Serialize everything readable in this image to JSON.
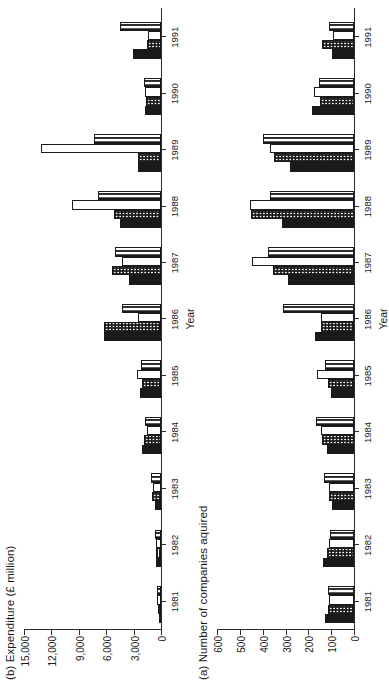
{
  "figure": {
    "orientation": "rotated-90-ccw",
    "panels": [
      "b",
      "a"
    ]
  },
  "panel_b": {
    "title": "(b) Expenditure (£ million)",
    "xlabel": "Year",
    "yticks": [
      "0",
      "3,000",
      "6,000",
      "9,000",
      "12,000",
      "15,000"
    ]
  },
  "panel_a": {
    "title": "(a) Number of companies aquired",
    "xlabel": "Year",
    "yticks": [
      "0",
      "100",
      "200",
      "300",
      "400",
      "500",
      "600"
    ]
  },
  "chart_data": [
    {
      "id": "panel_a",
      "type": "bar",
      "title": "(a) Number of companies aquired",
      "xlabel": "Year",
      "ylabel": "",
      "ylim": [
        0,
        600
      ],
      "yticks": [
        0,
        100,
        200,
        300,
        400,
        500,
        600
      ],
      "grid": false,
      "legend": "none",
      "orientation": "vertical-bars-rotated",
      "categories": [
        "1981",
        "1982",
        "1983",
        "1984",
        "1985",
        "1986",
        "1987",
        "1988",
        "1989",
        "1990",
        "1991"
      ],
      "series": [
        {
          "name": "series-1-solid",
          "pattern": "solid",
          "values": [
            125,
            135,
            95,
            120,
            100,
            170,
            290,
            315,
            280,
            185,
            95
          ]
        },
        {
          "name": "series-2-dotted",
          "pattern": "dotted",
          "values": [
            115,
            120,
            110,
            140,
            115,
            145,
            355,
            450,
            350,
            150,
            140
          ]
        },
        {
          "name": "series-3-open",
          "pattern": "open",
          "values": [
            110,
            110,
            110,
            145,
            160,
            145,
            445,
            455,
            370,
            175,
            90
          ]
        },
        {
          "name": "series-4-ladder",
          "pattern": "ladder",
          "values": [
            115,
            105,
            130,
            165,
            125,
            310,
            375,
            370,
            400,
            155,
            110
          ]
        }
      ]
    },
    {
      "id": "panel_b",
      "type": "bar",
      "title": "(b) Expenditure (£ million)",
      "xlabel": "Year",
      "ylabel": "",
      "ylim": [
        0,
        15000
      ],
      "yticks": [
        0,
        3000,
        6000,
        9000,
        12000,
        15000
      ],
      "grid": false,
      "legend": "none",
      "orientation": "vertical-bars-rotated",
      "categories": [
        "1981",
        "1982",
        "1983",
        "1984",
        "1985",
        "1986",
        "1987",
        "1988",
        "1989",
        "1990",
        "1991"
      ],
      "series": [
        {
          "name": "series-1-solid",
          "pattern": "solid",
          "values": [
            200,
            500,
            700,
            2100,
            2350,
            6200,
            3500,
            4500,
            2550,
            1750,
            3100
          ]
        },
        {
          "name": "series-2-dotted",
          "pattern": "dotted",
          "values": [
            350,
            600,
            1000,
            1900,
            2050,
            6200,
            5350,
            5200,
            2500,
            1650,
            1500
          ]
        },
        {
          "name": "series-3-open",
          "pattern": "open",
          "values": [
            420,
            550,
            900,
            1550,
            2600,
            2500,
            4300,
            9800,
            13100,
            1800,
            1400
          ]
        },
        {
          "name": "series-4-ladder",
          "pattern": "ladder",
          "values": [
            400,
            700,
            1100,
            1700,
            2150,
            4300,
            5000,
            6900,
            7300,
            1900,
            4500
          ]
        }
      ]
    }
  ]
}
